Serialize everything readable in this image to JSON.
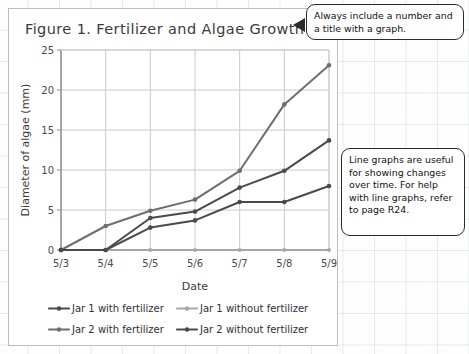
{
  "figure": {
    "title": "Figure 1. Fertilizer and Algae Growth"
  },
  "callouts": [
    {
      "id": "title-callout",
      "text": "Always include a number and a title with a graph."
    },
    {
      "id": "line-graph-callout",
      "text": "Line graphs are useful for showing changes over time. For help with line graphs, refer to page R24."
    }
  ],
  "colors": {
    "series_dark": "#4a4a4a",
    "series_mid": "#6e6e6e",
    "series_light": "#a8a8a8",
    "grid": "#c9c9d2",
    "axis": "#8a8a8a",
    "text": "#3b3b3b"
  },
  "chart_data": {
    "type": "line",
    "title": "Figure 1. Fertilizer and Algae Growth",
    "xlabel": "Date",
    "ylabel": "Diameter of algae (mm)",
    "categories": [
      "5/3",
      "5/4",
      "5/5",
      "5/6",
      "5/7",
      "5/8",
      "5/9"
    ],
    "ylim": [
      0,
      25
    ],
    "yticks": [
      0,
      5,
      10,
      15,
      20,
      25
    ],
    "grid": true,
    "legend_position": "bottom",
    "series": [
      {
        "name": "Jar 1 with fertilizer",
        "color": "#4a4a4a",
        "values": [
          0,
          0,
          4.0,
          4.8,
          7.8,
          9.9,
          13.7
        ]
      },
      {
        "name": "Jar 1 without fertilizer",
        "color": "#a8a8a8",
        "values": [
          0,
          0,
          0,
          0,
          0,
          0,
          0
        ]
      },
      {
        "name": "Jar 2 with fertilizer",
        "color": "#6e6e6e",
        "values": [
          0,
          3.0,
          4.9,
          6.3,
          9.9,
          18.2,
          23.1
        ]
      },
      {
        "name": "Jar 2 without fertilizer",
        "color": "#4a4a4a",
        "values": [
          0,
          0,
          2.8,
          3.7,
          6.0,
          6.0,
          8.0
        ]
      }
    ]
  },
  "legend": [
    {
      "label": "Jar 1 with fertilizer",
      "color": "#4a4a4a"
    },
    {
      "label": "Jar 1 without fertilizer",
      "color": "#a8a8a8"
    },
    {
      "label": "Jar 2 with fertilizer",
      "color": "#6e6e6e"
    },
    {
      "label": "Jar 2 without fertilizer",
      "color": "#4a4a4a"
    }
  ]
}
